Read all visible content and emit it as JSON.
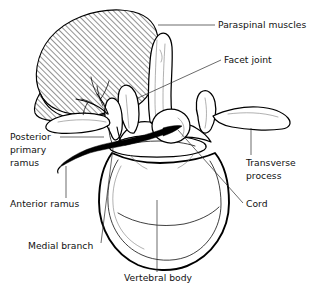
{
  "figure": {
    "width": 317,
    "height": 295,
    "background_color": "#ffffff",
    "ink_color": "#000000",
    "leader_color": "#2b2b2b"
  },
  "labels": [
    {
      "id": "paraspinal-muscles",
      "text": "Paraspinal muscles",
      "x": 218,
      "y": 28,
      "anchor": "start",
      "leader": {
        "x1": 215,
        "y1": 25,
        "x2": 158,
        "y2": 25
      }
    },
    {
      "id": "facet-joint",
      "text": "Facet joint",
      "x": 224,
      "y": 63,
      "anchor": "start",
      "leader": {
        "x1": 221,
        "y1": 60,
        "x2": 138,
        "y2": 98
      }
    },
    {
      "id": "transverse-process",
      "text": "Transverse",
      "text2": "process",
      "x": 246,
      "y": 166,
      "anchor": "start",
      "leader": {
        "x1": 251,
        "y1": 155,
        "x2": 251,
        "y2": 128
      }
    },
    {
      "id": "cord",
      "text": "Cord",
      "x": 246,
      "y": 207,
      "anchor": "start",
      "leader": {
        "x1": 243,
        "y1": 203,
        "x2": 178,
        "y2": 130
      }
    },
    {
      "id": "posterior-primary-ramus",
      "text": "Posterior",
      "text2": "primary",
      "text3": "ramus",
      "x": 10,
      "y": 140,
      "anchor": "start",
      "leader": {
        "x1": 60,
        "y1": 137,
        "x2": 104,
        "y2": 137
      }
    },
    {
      "id": "anterior-ramus",
      "text": "Anterior ramus",
      "x": 10,
      "y": 207,
      "anchor": "start",
      "leader": {
        "x1": 66,
        "y1": 198,
        "x2": 66,
        "y2": 166
      }
    },
    {
      "id": "medial-branch",
      "text": "Medial branch",
      "x": 28,
      "y": 249,
      "anchor": "start",
      "leader": {
        "x1": 101,
        "y1": 243,
        "x2": 113,
        "y2": 148
      }
    },
    {
      "id": "vertebral-body",
      "text": "Vertebral body",
      "x": 124,
      "y": 281,
      "anchor": "start",
      "leader": {
        "x1": 157,
        "y1": 272,
        "x2": 157,
        "y2": 200
      }
    }
  ],
  "structures": [
    {
      "id": "paraspinal-muscle-mass",
      "fill": "diagonal-hatch",
      "description": "large hatched mass upper-left"
    },
    {
      "id": "spinous-process",
      "description": "midline vertical bone projection"
    },
    {
      "id": "lamina",
      "description": "bone plate between spinous and facet"
    },
    {
      "id": "superior-articular-process-left",
      "description": "facet joint process, left"
    },
    {
      "id": "superior-articular-process-right",
      "description": "facet joint process, right"
    },
    {
      "id": "transverse-process-left",
      "description": "lateral wing, left"
    },
    {
      "id": "transverse-process-right",
      "description": "lateral wing, right"
    },
    {
      "id": "spinal-canal",
      "description": "opening containing cord"
    },
    {
      "id": "spinal-cord",
      "description": "round structure in canal"
    },
    {
      "id": "vertebral-body-mass",
      "description": "large oval body, lower center"
    },
    {
      "id": "posterior-primary-ramus-nerve",
      "description": "thick black nerve trunk to left"
    },
    {
      "id": "medial-branch-nerve",
      "description": "branch ascending into muscle"
    },
    {
      "id": "anterior-ramus-nerve",
      "description": "nerve tip at lower left"
    }
  ]
}
